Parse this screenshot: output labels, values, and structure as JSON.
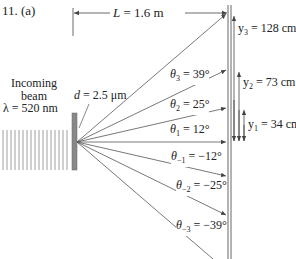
{
  "problem_label": "11. (a)",
  "distance": {
    "symbol": "L",
    "eq": " = 1.6 m"
  },
  "incoming": {
    "line1": "Incoming",
    "line2": "beam",
    "wavelength": "λ = 520 nm"
  },
  "spacing": {
    "symbol": "d",
    "eq": " = 2.5 μm"
  },
  "angles": [
    {
      "sym": "θ",
      "sub": "3",
      "eq": " = 39°"
    },
    {
      "sym": "θ",
      "sub": "2",
      "eq": " = 25°"
    },
    {
      "sym": "θ",
      "sub": "1",
      "eq": " = 12°"
    },
    {
      "sym": "θ",
      "sub": "−1",
      "eq": " = −12°"
    },
    {
      "sym": "θ",
      "sub": "−2",
      "eq": " = −25°"
    },
    {
      "sym": "θ",
      "sub": "−3",
      "eq": " = −39°"
    }
  ],
  "positions": [
    {
      "sym": "y",
      "sub": "3",
      "eq": " = 128 cm"
    },
    {
      "sym": "y",
      "sub": "2",
      "eq": " = 73 cm"
    },
    {
      "sym": "y",
      "sub": "1",
      "eq": " = 34 cm"
    }
  ],
  "colors": {
    "ray": "#555555",
    "grating": "#777777",
    "text": "#222222"
  }
}
